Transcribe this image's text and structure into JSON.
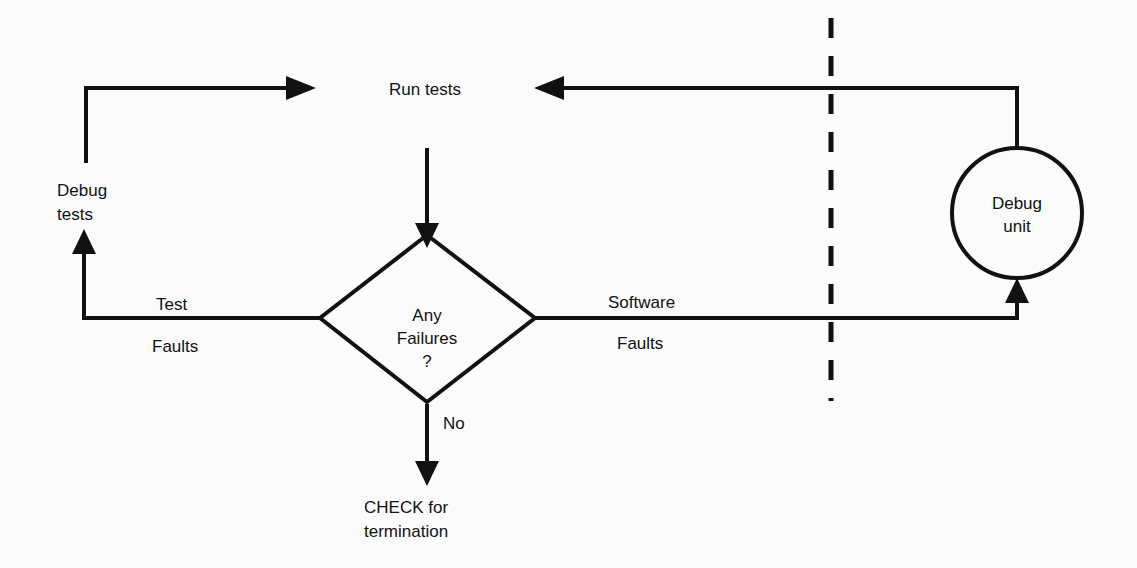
{
  "diagram": {
    "background_color": "#fbfbfb",
    "stroke_color": "#111111",
    "text_color": "#111111"
  },
  "nodes": {
    "decision": {
      "shape": "diamond",
      "line1": "Any",
      "line2": "Failures",
      "line3": "?"
    },
    "debug_unit": {
      "shape": "circle",
      "line1": "Debug",
      "line2": "unit"
    },
    "termination": {
      "shape": "text",
      "line1": "CHECK for",
      "line2": "termination"
    },
    "debug_tests": {
      "shape": "text",
      "line1": "Debug",
      "line2": "tests"
    }
  },
  "edge_labels": {
    "run_tests": "Run tests",
    "test": "Test",
    "faults_left": "Faults",
    "software": "Software",
    "faults_right": "Faults",
    "no": "No"
  },
  "separator": {
    "name": "dashed-boundary-line",
    "orientation": "vertical",
    "style": "dashed"
  }
}
